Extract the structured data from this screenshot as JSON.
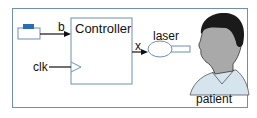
{
  "diagram": {
    "controller": {
      "label": "Controller"
    },
    "inputs": {
      "button_signal": "b",
      "clock_signal": "clk"
    },
    "output_signal": "x",
    "laser": {
      "label": "laser"
    },
    "patient": {
      "label": "patient"
    },
    "colors": {
      "frame": "#6f8fb0",
      "button_top": "#2a6db5",
      "button_body": "#ffffff",
      "laser_fill": "#ffffff",
      "laser_stroke": "#6f8fb0",
      "hair": "#1a1a1a",
      "skin": "#a9a9a9",
      "shirt": "#d6e4ee"
    }
  }
}
